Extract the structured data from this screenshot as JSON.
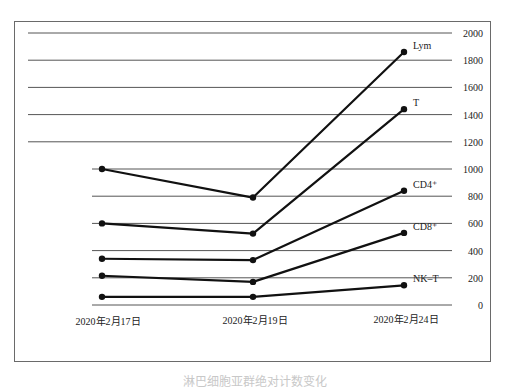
{
  "chart_data": {
    "type": "line",
    "title": "",
    "xlabel": "",
    "ylabel": "",
    "categories": [
      "2020年2月17日",
      "2020年2月19日",
      "2020年2月24日"
    ],
    "y_ticks": [
      0,
      200,
      400,
      600,
      800,
      1000,
      1200,
      1400,
      1600,
      1800,
      2000
    ],
    "ylim": [
      0,
      2000
    ],
    "y_axis_position": "right",
    "grid": true,
    "legend_position": "inline-right-end",
    "series": [
      {
        "name": "Lym",
        "label": "Lym",
        "values": [
          1000,
          790,
          1860
        ]
      },
      {
        "name": "T",
        "label": "T",
        "values": [
          600,
          525,
          1440
        ]
      },
      {
        "name": "CD4+",
        "label": "CD4⁺",
        "values": [
          340,
          330,
          840
        ]
      },
      {
        "name": "CD8+",
        "label": "CD8⁺",
        "values": [
          215,
          170,
          530
        ]
      },
      {
        "name": "NK-T",
        "label": "NK–T",
        "values": [
          60,
          60,
          145
        ]
      }
    ],
    "colors": {
      "line": "#111111",
      "grid": "#555555",
      "text": "#222222"
    }
  },
  "caption": "淋巴细胞亚群绝对计数变化"
}
